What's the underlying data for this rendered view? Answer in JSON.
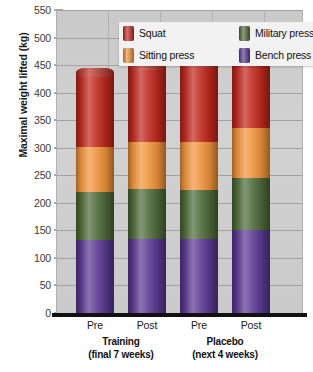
{
  "chart_data": {
    "type": "bar",
    "subtype": "stacked-bar",
    "title": "",
    "xlabel": "",
    "ylabel": "Maximal weight lifted (kg)",
    "ylim": [
      0,
      550
    ],
    "ytick_step": 50,
    "yticks": [
      0,
      50,
      100,
      150,
      200,
      250,
      300,
      350,
      400,
      450,
      500,
      550
    ],
    "grid": true,
    "legend_position": "top-inside",
    "categories": [
      "Pre",
      "Post",
      "Pre",
      "Post"
    ],
    "groups": [
      {
        "name": "Training",
        "sub": "(final 7 weeks)",
        "categories": [
          "Pre",
          "Post"
        ]
      },
      {
        "name": "Placebo",
        "sub": "(next 4 weeks)",
        "categories": [
          "Pre",
          "Post"
        ]
      }
    ],
    "series": [
      {
        "name": "Bench press",
        "color": "#5b3a93",
        "values": [
          133,
          135,
          135,
          151
        ]
      },
      {
        "name": "Military press",
        "color": "#4e6b3a",
        "values": [
          87,
          90,
          89,
          94
        ]
      },
      {
        "name": "Sitting press",
        "color": "#f0943c",
        "values": [
          82,
          85,
          86,
          90
        ]
      },
      {
        "name": "Squat",
        "color": "#c0291f",
        "values": [
          135,
          140,
          142,
          157
        ]
      }
    ],
    "cumulative_tops": [
      {
        "category": "Pre",
        "group": "Training",
        "bench_press": 133,
        "military_press": 220,
        "sitting_press": 302,
        "squat": 437
      },
      {
        "category": "Post",
        "group": "Training",
        "bench_press": 135,
        "military_press": 225,
        "sitting_press": 310,
        "squat": 450
      },
      {
        "category": "Pre",
        "group": "Placebo",
        "bench_press": 135,
        "military_press": 224,
        "sitting_press": 310,
        "squat": 452
      },
      {
        "category": "Post",
        "group": "Placebo",
        "bench_press": 151,
        "military_press": 245,
        "sitting_press": 335,
        "squat": 492
      }
    ],
    "totals": [
      437,
      450,
      452,
      492
    ]
  },
  "legend": {
    "items": [
      {
        "label": "Squat",
        "color": "#c0291f",
        "icon": "legend-swatch-squat"
      },
      {
        "label": "Military press",
        "color": "#4e6b3a",
        "icon": "legend-swatch-military-press"
      },
      {
        "label": "Sitting press",
        "color": "#f0943c",
        "icon": "legend-swatch-sitting-press"
      },
      {
        "label": "Bench press",
        "color": "#5b3a93",
        "icon": "legend-swatch-bench-press"
      }
    ]
  },
  "axes": {
    "y_title": "Maximal weight lifted (kg)",
    "y_ticks": [
      "550",
      "500",
      "450",
      "400",
      "350",
      "300",
      "250",
      "200",
      "150",
      "100",
      "50",
      "0"
    ],
    "x_ticks": [
      "Pre",
      "Post",
      "Pre",
      "Post"
    ],
    "group_labels": [
      {
        "name": "Training",
        "sub": "(final 7 weeks)"
      },
      {
        "name": "Placebo",
        "sub": "(next 4 weeks)"
      }
    ]
  },
  "colors": {
    "squat": "#c0291f",
    "sitting_press": "#f0943c",
    "military_press": "#4e6b3a",
    "bench_press": "#5b3a93",
    "plot_background": "#cfcfcf",
    "gridline": "#9a9a9a",
    "axis": "#111111"
  }
}
